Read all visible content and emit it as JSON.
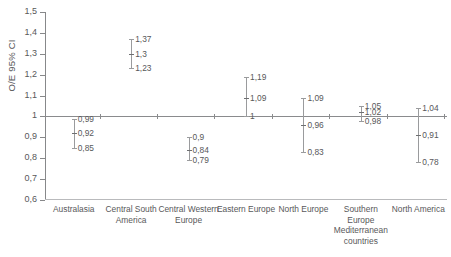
{
  "chart_data": {
    "type": "scatter",
    "title": "",
    "subtitle": "",
    "xlabel": "",
    "ylabel": "O/E 95% CI",
    "ylim": [
      0.6,
      1.5
    ],
    "ytick_labels": [
      "1,5",
      "1,4",
      "1,3",
      "1,2",
      "1,1",
      "1",
      "0,9",
      "0,8",
      "0,7",
      "0,6"
    ],
    "ytick_values": [
      1.5,
      1.4,
      1.3,
      1.2,
      1.1,
      1.0,
      0.9,
      0.8,
      0.7,
      0.6
    ],
    "grid": false,
    "legend": "none",
    "reference_line": 1.0,
    "categories": [
      "Australasia",
      "Central South America",
      "Central Western Europe",
      "Eastern Europe",
      "North Europe",
      "Southern Europe Mediterranean countries",
      "North America"
    ],
    "points": [
      {
        "category": "Australasia",
        "estimate": 0.92,
        "ci_low": 0.85,
        "ci_high": 0.99,
        "estimate_label": "0,92",
        "ci_low_label": "0,85",
        "ci_high_label": "0,99"
      },
      {
        "category": "Central South America",
        "estimate": 1.3,
        "ci_low": 1.23,
        "ci_high": 1.37,
        "estimate_label": "1,3",
        "ci_low_label": "1,23",
        "ci_high_label": "1,37"
      },
      {
        "category": "Central Western Europe",
        "estimate": 0.84,
        "ci_low": 0.79,
        "ci_high": 0.9,
        "estimate_label": "0,84",
        "ci_low_label": "0,79",
        "ci_high_label": "0,9"
      },
      {
        "category": "Eastern Europe",
        "estimate": 1.09,
        "ci_low": 1.0,
        "ci_high": 1.19,
        "estimate_label": "1,09",
        "ci_low_label": "1",
        "ci_high_label": "1,19"
      },
      {
        "category": "North Europe",
        "estimate": 0.96,
        "ci_low": 0.83,
        "ci_high": 1.09,
        "estimate_label": "0,96",
        "ci_low_label": "0,83",
        "ci_high_label": "1,09"
      },
      {
        "category": "Southern Europe Mediterranean countries",
        "estimate": 1.02,
        "ci_low": 0.98,
        "ci_high": 1.05,
        "estimate_label": "1,02",
        "ci_low_label": "0,98",
        "ci_high_label": "1,05"
      },
      {
        "category": "North America",
        "estimate": 0.91,
        "ci_low": 0.78,
        "ci_high": 1.04,
        "estimate_label": "0,91",
        "ci_low_label": "0,78",
        "ci_high_label": "1,04"
      }
    ]
  },
  "colors": {
    "axis": "#87888a",
    "reference_line": "#8a8b8d",
    "whisker": "#9a9b9d",
    "marker": "#6e6f71",
    "text": "#58585a",
    "background": "#ffffff"
  }
}
